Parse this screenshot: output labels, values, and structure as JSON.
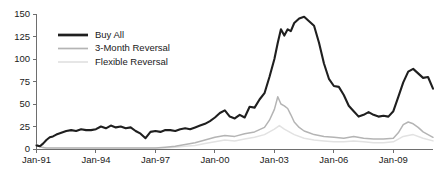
{
  "chart_data": {
    "type": "line",
    "title": "",
    "subtitle": "",
    "xlabel": "",
    "ylabel": "",
    "xlim": [
      1991.0,
      2011.0
    ],
    "ylim": [
      0,
      150
    ],
    "grid": false,
    "legend_position": "upper-left",
    "y_ticks": [
      0,
      25,
      50,
      75,
      100,
      125,
      150
    ],
    "y_tick_labels": [
      "0",
      "25",
      "50",
      "75",
      "100",
      "125",
      "150"
    ],
    "x_ticks": [
      1991,
      1994,
      1997,
      2000,
      2003,
      2006,
      2009
    ],
    "x_tick_labels": [
      "Jan-91",
      "Jan-94",
      "Jan-97",
      "Jan-00",
      "Jan-03",
      "Jan-06",
      "Jan-09"
    ],
    "colors": {
      "buy_all": "#1f1f1f",
      "three_month_reversal": "#b4b4b4",
      "flexible_reversal": "#e2e2e2",
      "axis": "#6e6e6e",
      "text": "#1a1a1a",
      "background": "#ffffff"
    },
    "series": [
      {
        "name": "Buy All",
        "color": "#1f1f1f",
        "width": 2.1,
        "x": [
          1991.0,
          1991.17,
          1991.33,
          1991.5,
          1991.67,
          1991.83,
          1992.0,
          1992.25,
          1992.5,
          1992.75,
          1993.0,
          1993.25,
          1993.5,
          1993.75,
          1994.0,
          1994.25,
          1994.5,
          1994.75,
          1995.0,
          1995.25,
          1995.5,
          1995.75,
          1996.0,
          1996.25,
          1996.5,
          1996.75,
          1997.0,
          1997.25,
          1997.5,
          1997.75,
          1998.0,
          1998.25,
          1998.5,
          1998.75,
          1999.0,
          1999.25,
          1999.5,
          1999.75,
          2000.0,
          2000.25,
          2000.5,
          2000.75,
          2001.0,
          2001.25,
          2001.5,
          2001.75,
          2002.0,
          2002.25,
          2002.5,
          2002.75,
          2003.0,
          2003.17,
          2003.33,
          2003.5,
          2003.67,
          2003.83,
          2004.0,
          2004.25,
          2004.5,
          2004.75,
          2005.0,
          2005.25,
          2005.5,
          2005.75,
          2006.0,
          2006.25,
          2006.5,
          2006.75,
          2007.0,
          2007.25,
          2007.5,
          2007.75,
          2008.0,
          2008.25,
          2008.5,
          2008.75,
          2009.0,
          2009.25,
          2009.5,
          2009.75,
          2010.0,
          2010.25,
          2010.5,
          2010.75,
          2011.0
        ],
        "values": [
          4,
          3,
          6,
          10,
          13,
          14,
          16,
          18,
          20,
          21,
          20,
          22,
          21,
          21,
          22,
          25,
          23,
          26,
          24,
          25,
          23,
          24,
          20,
          17,
          12,
          19,
          20,
          19,
          21,
          21,
          20,
          22,
          23,
          22,
          24,
          26,
          28,
          31,
          35,
          40,
          43,
          36,
          34,
          38,
          35,
          47,
          46,
          55,
          62,
          80,
          100,
          118,
          133,
          126,
          133,
          131,
          140,
          145,
          147,
          142,
          137,
          118,
          95,
          78,
          70,
          69,
          60,
          48,
          42,
          36,
          38,
          41,
          38,
          36,
          37,
          36,
          42,
          58,
          74,
          86,
          89,
          84,
          79,
          80,
          67
        ]
      },
      {
        "name": "3-Month Reversal",
        "color": "#b4b4b4",
        "width": 1.5,
        "x": [
          1991.0,
          1991.25,
          1991.5,
          1991.75,
          1992.0,
          1992.5,
          1993.0,
          1993.5,
          1994.0,
          1994.5,
          1995.0,
          1995.5,
          1996.0,
          1996.5,
          1997.0,
          1997.5,
          1998.0,
          1998.5,
          1999.0,
          1999.5,
          2000.0,
          2000.5,
          2001.0,
          2001.5,
          2002.0,
          2002.5,
          2002.75,
          2003.0,
          2003.17,
          2003.33,
          2003.5,
          2003.67,
          2003.83,
          2004.0,
          2004.25,
          2004.5,
          2004.75,
          2005.0,
          2005.5,
          2006.0,
          2006.5,
          2007.0,
          2007.5,
          2008.0,
          2008.5,
          2009.0,
          2009.25,
          2009.5,
          2009.75,
          2010.0,
          2010.25,
          2010.5,
          2010.75,
          2011.0
        ],
        "values": [
          5,
          2,
          1,
          1,
          1,
          1,
          1,
          1,
          1,
          1,
          1,
          1,
          1,
          1,
          1,
          2,
          3,
          5,
          7,
          10,
          13,
          15,
          14,
          17,
          19,
          24,
          32,
          44,
          58,
          50,
          48,
          45,
          38,
          30,
          24,
          20,
          18,
          16,
          14,
          13,
          12,
          14,
          12,
          11,
          11,
          12,
          18,
          27,
          30,
          28,
          24,
          19,
          16,
          13
        ]
      },
      {
        "name": "Flexible Reversal",
        "color": "#e2e2e2",
        "width": 1.5,
        "x": [
          1991.0,
          1991.25,
          1991.5,
          1992.0,
          1992.5,
          1993.0,
          1993.5,
          1994.0,
          1994.5,
          1995.0,
          1995.5,
          1996.0,
          1996.5,
          1997.0,
          1997.5,
          1998.0,
          1998.5,
          1999.0,
          1999.5,
          2000.0,
          2000.5,
          2001.0,
          2001.5,
          2002.0,
          2002.5,
          2003.0,
          2003.25,
          2003.5,
          2004.0,
          2004.5,
          2005.0,
          2005.5,
          2006.0,
          2006.5,
          2007.0,
          2007.5,
          2008.0,
          2008.5,
          2009.0,
          2009.5,
          2010.0,
          2010.5,
          2011.0
        ],
        "values": [
          4,
          2,
          1,
          1,
          1,
          1,
          1,
          1,
          1,
          1,
          1,
          1,
          1,
          1,
          1,
          2,
          3,
          4,
          6,
          8,
          10,
          9,
          11,
          13,
          16,
          22,
          26,
          22,
          16,
          12,
          10,
          9,
          8,
          8,
          9,
          8,
          7,
          7,
          8,
          14,
          16,
          12,
          9
        ]
      }
    ]
  },
  "legend": {
    "entries": [
      {
        "label": "Buy All"
      },
      {
        "label": "3-Month Reversal"
      },
      {
        "label": "Flexible Reversal"
      }
    ]
  }
}
